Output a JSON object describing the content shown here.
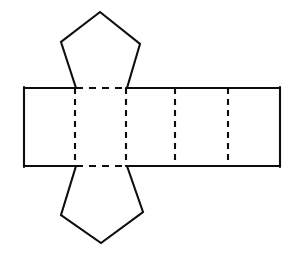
{
  "figure": {
    "canvas": {
      "width": 297,
      "height": 253,
      "background": "#ffffff"
    },
    "style": {
      "line_color": "#0d0d0d",
      "fill_color": "#ffffff",
      "solid_stroke_width": 2.1,
      "fold_stroke_width": 2.1,
      "fold_dash_pattern": "6 5"
    },
    "strip": {
      "name": "lateral-face-strip",
      "top_y": 88,
      "bottom_y": 166,
      "left_x": 24,
      "right_x": 280,
      "outline_points": "24,88 280,88 280,166 24,166",
      "fold_x_positions": [
        75,
        126,
        175,
        228
      ],
      "face_count": 5,
      "faces": [
        {
          "id": "face-1",
          "x_start": 24,
          "x_end": 75
        },
        {
          "id": "face-2",
          "x_start": 75,
          "x_end": 126
        },
        {
          "id": "face-3",
          "x_start": 126,
          "x_end": 175
        },
        {
          "id": "face-4",
          "x_start": 175,
          "x_end": 228
        },
        {
          "id": "face-5",
          "x_start": 228,
          "x_end": 280
        }
      ]
    },
    "top_pentagon": {
      "name": "top-pentagon-face",
      "points": "76,88 61,42 100,12 140,44 127,88",
      "apex": {
        "x": 100,
        "y": 12
      },
      "left_vertex": {
        "x": 61,
        "y": 42
      },
      "right_vertex": {
        "x": 140,
        "y": 44
      },
      "base_left": {
        "x": 76,
        "y": 88
      },
      "base_right": {
        "x": 127,
        "y": 88
      },
      "open_path": "76,88 61,42 100,12 140,44 127,88"
    },
    "bottom_pentagon": {
      "name": "bottom-pentagon-face",
      "points": "76,166 61,215 101,243 143,212 127,166",
      "apex": {
        "x": 101,
        "y": 243
      },
      "left_vertex": {
        "x": 61,
        "y": 215
      },
      "right_vertex": {
        "x": 143,
        "y": 212
      },
      "base_left": {
        "x": 76,
        "y": 166
      },
      "base_right": {
        "x": 127,
        "y": 166
      },
      "open_path": "76,166 61,215 101,243 143,212 127,166"
    },
    "fold_lines": {
      "name": "fold-lines",
      "vertical": [
        {
          "id": "fold-v-1",
          "x": 75,
          "y1": 88,
          "y2": 166
        },
        {
          "id": "fold-v-2",
          "x": 126,
          "y1": 88,
          "y2": 166
        },
        {
          "id": "fold-v-3",
          "x": 175,
          "y1": 88,
          "y2": 166
        },
        {
          "id": "fold-v-4",
          "x": 228,
          "y1": 88,
          "y2": 166
        }
      ],
      "horizontal": [
        {
          "id": "fold-h-top",
          "y": 88,
          "x1": 76,
          "x2": 127
        },
        {
          "id": "fold-h-bottom",
          "y": 166,
          "x1": 76,
          "x2": 127
        }
      ]
    }
  }
}
